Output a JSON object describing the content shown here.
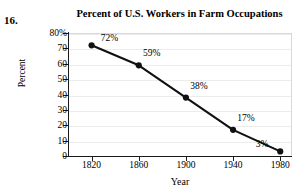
{
  "exercise": {
    "number_label": "16."
  },
  "chart_data": {
    "type": "line",
    "title": "Percent of U.S. Workers in Farm Occupations",
    "xlabel": "Year",
    "ylabel": "Percent",
    "categories": [
      1820,
      1860,
      1900,
      1940,
      1980
    ],
    "x_tick_labels": [
      "1820",
      "1860",
      "1900",
      "1940",
      "1980"
    ],
    "values": [
      72,
      59,
      38,
      17,
      3
    ],
    "point_labels": [
      "72%",
      "59%",
      "38%",
      "17%",
      "3%"
    ],
    "y_tick_labels": [
      "80%",
      "70",
      "60",
      "50",
      "40",
      "30",
      "20",
      "10",
      "0"
    ],
    "y_ticks": [
      80,
      70,
      60,
      50,
      40,
      30,
      20,
      10,
      0
    ],
    "ylim": [
      0,
      80
    ],
    "xlim": [
      1800,
      1990
    ],
    "grid": "horizontal",
    "legend": "none",
    "line_color": "#111111",
    "marker": "circle",
    "marker_color": "#111111",
    "gridline_color": "#ececec",
    "axis_color": "#1a1a1a",
    "background_color": "#ffffff"
  }
}
